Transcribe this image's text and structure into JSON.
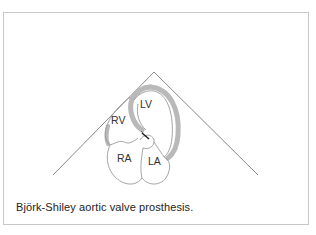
{
  "figure": {
    "caption": "Björk-Shiley aortic valve prosthesis.",
    "labels": {
      "lv": "LV",
      "rv": "RV",
      "ra": "RA",
      "la": "LA"
    },
    "colors": {
      "border": "#c8c8c8",
      "wall": "#b9b9b9",
      "outline": "#9a9a9a",
      "sector": "#7a7a7a",
      "valve": "#222222"
    }
  }
}
